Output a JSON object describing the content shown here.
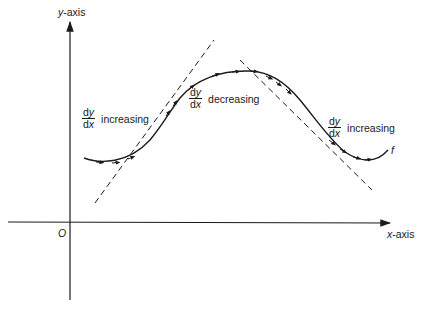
{
  "figure": {
    "y_axis_label": "y-axis",
    "y_axis_label_var": "y",
    "y_axis_label_rest": "-axis",
    "x_axis_label_var": "x",
    "x_axis_label_rest": "-axis",
    "origin_label": "O",
    "curve_label": "f",
    "annotations": [
      {
        "numerator_d": "d",
        "numerator_var": "y",
        "denominator_d": "d",
        "denominator_var": "x",
        "text": "increasing"
      },
      {
        "numerator_d": "d",
        "numerator_var": "y",
        "denominator_d": "d",
        "denominator_var": "x",
        "text": "decreasing"
      },
      {
        "numerator_d": "d",
        "numerator_var": "y",
        "denominator_d": "d",
        "denominator_var": "x",
        "text": "increasing"
      }
    ],
    "colors": {
      "line": "#1a1a1a",
      "background": "#ffffff"
    }
  }
}
